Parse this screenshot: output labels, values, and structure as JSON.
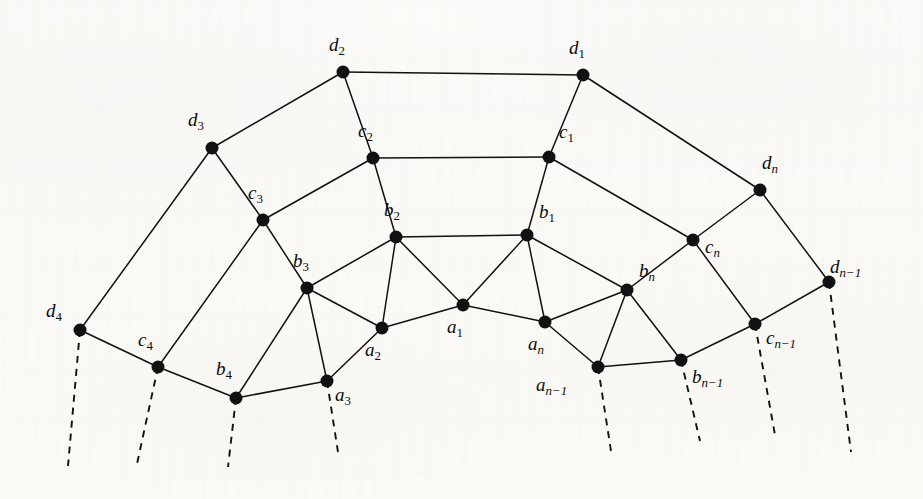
{
  "figure": {
    "type": "graph-diagram",
    "title": "",
    "background_color": "#fbfaf7",
    "ink_color": "#111111",
    "node_radius": 6.5,
    "edge_width": 1.5,
    "dash_pattern": "7 6",
    "width": 923,
    "height": 499
  },
  "chart_data": {
    "type": "graph",
    "vertex_rings": [
      "a",
      "b",
      "c",
      "d"
    ],
    "nodes": [
      {
        "id": "a1",
        "base": "a",
        "sub": "1",
        "x": 463,
        "y": 305,
        "label_dx": -10,
        "label_dy": 18
      },
      {
        "id": "a2",
        "base": "a",
        "sub": "2",
        "x": 382,
        "y": 328,
        "label_dx": -11,
        "label_dy": 18
      },
      {
        "id": "a3",
        "base": "a",
        "sub": "3",
        "x": 327,
        "y": 381,
        "label_dx": 8,
        "label_dy": 10
      },
      {
        "id": "an",
        "base": "a",
        "sub": "n",
        "x": 545,
        "y": 322,
        "label_dx": -11,
        "label_dy": 18
      },
      {
        "id": "an1",
        "base": "a",
        "sub": "n−1",
        "x": 598,
        "y": 367,
        "label_dx": -62,
        "label_dy": 14
      },
      {
        "id": "b1",
        "base": "b",
        "sub": "1",
        "x": 527,
        "y": 235,
        "label_dx": 12,
        "label_dy": -10
      },
      {
        "id": "b2",
        "base": "b",
        "sub": "2",
        "x": 396,
        "y": 237,
        "label_dx": -6,
        "label_dy": -14
      },
      {
        "id": "b3",
        "base": "b",
        "sub": "3",
        "x": 307,
        "y": 288,
        "label_dx": -8,
        "label_dy": -14
      },
      {
        "id": "b4",
        "base": "b",
        "sub": "4",
        "x": 236,
        "y": 398,
        "label_dx": -14,
        "label_dy": -16
      },
      {
        "id": "bn",
        "base": "b",
        "sub": "n",
        "x": 627,
        "y": 290,
        "label_dx": 12,
        "label_dy": -6
      },
      {
        "id": "bn1",
        "base": "b",
        "sub": "n−1",
        "x": 681,
        "y": 360,
        "label_dx": 11,
        "label_dy": 13
      },
      {
        "id": "c1",
        "base": "c",
        "sub": "1",
        "x": 549,
        "y": 157,
        "label_dx": 10,
        "label_dy": -12
      },
      {
        "id": "c2",
        "base": "c",
        "sub": "2",
        "x": 373,
        "y": 158,
        "label_dx": -10,
        "label_dy": -14
      },
      {
        "id": "c3",
        "base": "c",
        "sub": "3",
        "x": 263,
        "y": 220,
        "label_dx": -10,
        "label_dy": -14
      },
      {
        "id": "c4",
        "base": "c",
        "sub": "4",
        "x": 158,
        "y": 367,
        "label_dx": -15,
        "label_dy": -14
      },
      {
        "id": "cn",
        "base": "c",
        "sub": "n",
        "x": 693,
        "y": 240,
        "label_dx": 12,
        "label_dy": 3
      },
      {
        "id": "cn1",
        "base": "c",
        "sub": "n−1",
        "x": 755,
        "y": 324,
        "label_dx": 11,
        "label_dy": 10
      },
      {
        "id": "d1",
        "base": "d",
        "sub": "1",
        "x": 583,
        "y": 75,
        "label_dx": -8,
        "label_dy": -14
      },
      {
        "id": "d2",
        "base": "d",
        "sub": "2",
        "x": 343,
        "y": 72,
        "label_dx": -8,
        "label_dy": -14
      },
      {
        "id": "d3",
        "base": "d",
        "sub": "3",
        "x": 212,
        "y": 148,
        "label_dx": -18,
        "label_dy": -15
      },
      {
        "id": "d4",
        "base": "d",
        "sub": "4",
        "x": 80,
        "y": 330,
        "label_dx": -34,
        "label_dy": -6
      },
      {
        "id": "dn",
        "base": "d",
        "sub": "n",
        "x": 760,
        "y": 190,
        "label_dx": 2,
        "label_dy": -14
      },
      {
        "id": "dn1",
        "base": "d",
        "sub": "n−1",
        "x": 829,
        "y": 282,
        "label_dx": 1,
        "label_dy": -2
      }
    ],
    "edges": [
      [
        "a1",
        "a2"
      ],
      [
        "a1",
        "an"
      ],
      [
        "a1",
        "b1"
      ],
      [
        "a1",
        "b2"
      ],
      [
        "a2",
        "a3"
      ],
      [
        "a2",
        "b2"
      ],
      [
        "a2",
        "b3"
      ],
      [
        "a3",
        "b3"
      ],
      [
        "a3",
        "b4"
      ],
      [
        "an",
        "an1"
      ],
      [
        "an",
        "b1"
      ],
      [
        "an",
        "bn"
      ],
      [
        "an1",
        "bn"
      ],
      [
        "an1",
        "bn1"
      ],
      [
        "b1",
        "b2"
      ],
      [
        "b1",
        "bn"
      ],
      [
        "b1",
        "c1"
      ],
      [
        "b2",
        "b3"
      ],
      [
        "b2",
        "c2"
      ],
      [
        "b3",
        "b4"
      ],
      [
        "b3",
        "c3"
      ],
      [
        "b4",
        "c4"
      ],
      [
        "bn",
        "bn1"
      ],
      [
        "bn",
        "cn"
      ],
      [
        "bn1",
        "cn1"
      ],
      [
        "c1",
        "c2"
      ],
      [
        "c1",
        "cn"
      ],
      [
        "c1",
        "d1"
      ],
      [
        "c2",
        "c3"
      ],
      [
        "c2",
        "d2"
      ],
      [
        "c3",
        "c4"
      ],
      [
        "c3",
        "d3"
      ],
      [
        "c4",
        "d4"
      ],
      [
        "cn",
        "cn1"
      ],
      [
        "cn",
        "dn"
      ],
      [
        "cn1",
        "dn1"
      ],
      [
        "d1",
        "d2"
      ],
      [
        "d1",
        "dn"
      ],
      [
        "d2",
        "d3"
      ],
      [
        "d3",
        "d4"
      ],
      [
        "dn",
        "dn1"
      ]
    ],
    "dashed_edges": [
      {
        "from": "d4",
        "x1": 80,
        "y1": 330,
        "x2": 68,
        "y2": 466
      },
      {
        "from": "c4",
        "x1": 158,
        "y1": 367,
        "x2": 137,
        "y2": 464
      },
      {
        "from": "b4",
        "x1": 236,
        "y1": 398,
        "x2": 228,
        "y2": 467
      },
      {
        "from": "a3",
        "x1": 327,
        "y1": 381,
        "x2": 338,
        "y2": 452
      },
      {
        "from": "an1",
        "x1": 598,
        "y1": 367,
        "x2": 611,
        "y2": 451
      },
      {
        "from": "bn1",
        "x1": 681,
        "y1": 360,
        "x2": 700,
        "y2": 441
      },
      {
        "from": "cn1",
        "x1": 755,
        "y1": 324,
        "x2": 775,
        "y2": 435
      },
      {
        "from": "dn1",
        "x1": 829,
        "y1": 282,
        "x2": 851,
        "y2": 452
      }
    ],
    "xlabel": "",
    "ylabel": "",
    "grid": false,
    "legend": false
  }
}
